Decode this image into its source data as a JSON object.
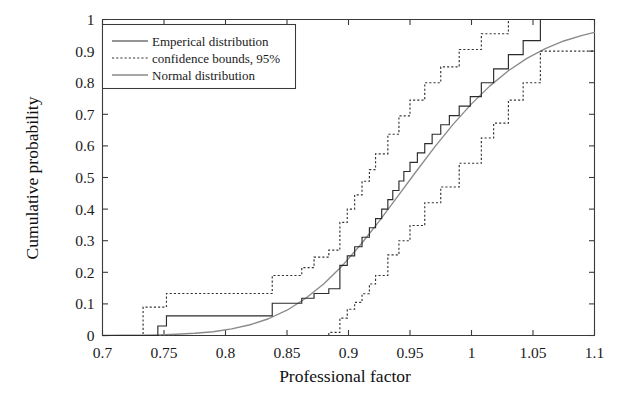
{
  "chart_data": {
    "type": "line",
    "title": "",
    "xlabel": "Professional factor",
    "ylabel": "Cumulative probability",
    "xlim": [
      0.7,
      1.1
    ],
    "ylim": [
      0,
      1
    ],
    "xticks": [
      0.7,
      0.75,
      0.8,
      0.85,
      0.9,
      0.95,
      1,
      1.05,
      1.1
    ],
    "xtick_labels": [
      "0.7",
      "0.75",
      "0.8",
      "0.85",
      "0.9",
      "0.95",
      "1",
      "1.05",
      "1.1"
    ],
    "yticks": [
      0,
      0.1,
      0.2,
      0.3,
      0.4,
      0.5,
      0.6,
      0.7,
      0.8,
      0.9,
      1
    ],
    "ytick_labels": [
      "0",
      "0.1",
      "0.2",
      "0.3",
      "0.4",
      "0.5",
      "0.6",
      "0.7",
      "0.8",
      "0.9",
      "1"
    ],
    "grid": false,
    "legend_position": "upper-left",
    "legend": [
      {
        "label": "Emperical distribution",
        "style": "solid",
        "color": "#2b2b2b"
      },
      {
        "label": "confidence bounds, 95%",
        "style": "dotted",
        "color": "#333333"
      },
      {
        "label": "Normal distribution",
        "style": "solid",
        "color": "#8a8a8a"
      }
    ],
    "series": [
      {
        "name": "Emperical distribution",
        "style": "step",
        "x": [
          0.7,
          0.745,
          0.745,
          0.752,
          0.752,
          0.838,
          0.838,
          0.862,
          0.862,
          0.872,
          0.872,
          0.884,
          0.884,
          0.893,
          0.893,
          0.899,
          0.899,
          0.905,
          0.905,
          0.911,
          0.911,
          0.917,
          0.917,
          0.922,
          0.922,
          0.927,
          0.927,
          0.932,
          0.932,
          0.936,
          0.936,
          0.941,
          0.941,
          0.945,
          0.945,
          0.95,
          0.95,
          0.956,
          0.956,
          0.962,
          0.962,
          0.968,
          0.968,
          0.975,
          0.975,
          0.982,
          0.982,
          0.99,
          0.99,
          0.999,
          0.999,
          1.008,
          1.008,
          1.018,
          1.018,
          1.03,
          1.03,
          1.042,
          1.042,
          1.056,
          1.056,
          1.1
        ],
        "y": [
          0.0,
          0.0,
          0.03,
          0.03,
          0.062,
          0.062,
          0.102,
          0.102,
          0.118,
          0.118,
          0.133,
          0.133,
          0.148,
          0.148,
          0.222,
          0.222,
          0.252,
          0.252,
          0.281,
          0.281,
          0.311,
          0.311,
          0.341,
          0.341,
          0.37,
          0.37,
          0.4,
          0.4,
          0.43,
          0.43,
          0.459,
          0.459,
          0.489,
          0.489,
          0.519,
          0.519,
          0.548,
          0.548,
          0.578,
          0.578,
          0.607,
          0.607,
          0.637,
          0.637,
          0.667,
          0.667,
          0.696,
          0.696,
          0.726,
          0.726,
          0.756,
          0.756,
          0.8,
          0.8,
          0.844,
          0.844,
          0.889,
          0.889,
          0.933,
          0.933,
          1.0,
          1.0
        ]
      },
      {
        "name": "confidence bound upper, 95%",
        "style": "step",
        "x": [
          0.7,
          0.733,
          0.733,
          0.752,
          0.752,
          0.838,
          0.838,
          0.862,
          0.862,
          0.872,
          0.872,
          0.884,
          0.884,
          0.893,
          0.893,
          0.899,
          0.899,
          0.905,
          0.905,
          0.911,
          0.911,
          0.917,
          0.917,
          0.922,
          0.922,
          0.932,
          0.932,
          0.941,
          0.941,
          0.95,
          0.95,
          0.962,
          0.962,
          0.975,
          0.975,
          0.99,
          0.99,
          1.008,
          1.008,
          1.03,
          1.03,
          1.1
        ],
        "y": [
          0.0,
          0.0,
          0.09,
          0.09,
          0.133,
          0.133,
          0.19,
          0.19,
          0.215,
          0.215,
          0.248,
          0.248,
          0.27,
          0.27,
          0.358,
          0.358,
          0.4,
          0.4,
          0.445,
          0.445,
          0.488,
          0.488,
          0.525,
          0.525,
          0.575,
          0.575,
          0.637,
          0.637,
          0.695,
          0.695,
          0.745,
          0.745,
          0.8,
          0.8,
          0.85,
          0.85,
          0.905,
          0.905,
          0.955,
          0.955,
          1.0,
          1.0
        ]
      },
      {
        "name": "confidence bound lower, 95%",
        "style": "step",
        "x": [
          0.7,
          0.884,
          0.884,
          0.893,
          0.893,
          0.899,
          0.899,
          0.905,
          0.905,
          0.911,
          0.911,
          0.917,
          0.917,
          0.922,
          0.922,
          0.932,
          0.932,
          0.941,
          0.941,
          0.95,
          0.95,
          0.962,
          0.962,
          0.975,
          0.975,
          0.99,
          0.99,
          1.008,
          1.008,
          1.018,
          1.018,
          1.03,
          1.03,
          1.042,
          1.042,
          1.056,
          1.056,
          1.1
        ],
        "y": [
          0.0,
          0.0,
          0.01,
          0.01,
          0.055,
          0.055,
          0.083,
          0.083,
          0.105,
          0.105,
          0.132,
          0.132,
          0.163,
          0.163,
          0.19,
          0.19,
          0.255,
          0.255,
          0.3,
          0.3,
          0.348,
          0.348,
          0.42,
          0.42,
          0.47,
          0.47,
          0.545,
          0.545,
          0.625,
          0.625,
          0.672,
          0.672,
          0.745,
          0.745,
          0.8,
          0.8,
          0.9,
          0.9
        ]
      },
      {
        "name": "Normal distribution",
        "style": "smooth",
        "mean": 0.953,
        "sigma": 0.063,
        "x": [
          0.7,
          0.715,
          0.73,
          0.745,
          0.76,
          0.775,
          0.79,
          0.805,
          0.82,
          0.835,
          0.85,
          0.865,
          0.88,
          0.895,
          0.91,
          0.925,
          0.94,
          0.955,
          0.97,
          0.985,
          1.0,
          1.015,
          1.03,
          1.045,
          1.06,
          1.075,
          1.09,
          1.1
        ],
        "y": [
          0.0,
          0.001,
          0.001,
          0.002,
          0.004,
          0.007,
          0.012,
          0.021,
          0.034,
          0.053,
          0.08,
          0.117,
          0.164,
          0.221,
          0.288,
          0.362,
          0.44,
          0.519,
          0.596,
          0.668,
          0.733,
          0.79,
          0.838,
          0.877,
          0.908,
          0.932,
          0.95,
          0.959
        ]
      }
    ]
  }
}
